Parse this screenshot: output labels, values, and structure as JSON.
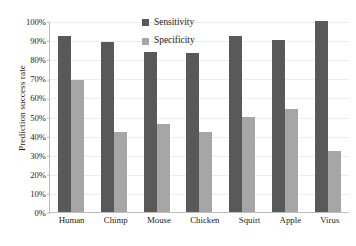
{
  "chart_data": {
    "type": "bar",
    "title": "",
    "xlabel": "",
    "ylabel": "Prediction success rate",
    "ylim": [
      0,
      100
    ],
    "ytick_labels": [
      "100%",
      "90%",
      "80%",
      "70%",
      "60%",
      "50%",
      "40%",
      "30%",
      "20%",
      "10%",
      "0%"
    ],
    "ytick_values": [
      100,
      90,
      80,
      70,
      60,
      50,
      40,
      30,
      20,
      10,
      0
    ],
    "grid": true,
    "legend_position": "top-center",
    "categories": [
      "Human",
      "Chimp",
      "Mouse",
      "Chicken",
      "Squirt",
      "Apple",
      "Virus"
    ],
    "series": [
      {
        "name": "Sensitivity",
        "color": "#595959",
        "values": [
          92,
          89,
          84,
          83,
          92,
          90,
          100
        ]
      },
      {
        "name": "Specificity",
        "color": "#a6a6a6",
        "values": [
          69,
          42,
          46,
          42,
          50,
          54,
          32
        ]
      }
    ]
  }
}
